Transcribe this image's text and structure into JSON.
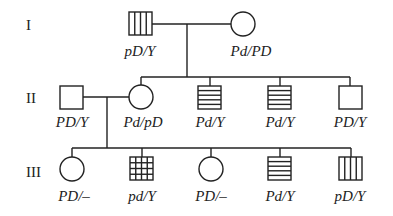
{
  "generations": [
    {
      "label": "I"
    },
    {
      "label": "II"
    },
    {
      "label": "III"
    }
  ],
  "individuals": {
    "I_1": {
      "sex": "male",
      "pattern": "vertical-stripes",
      "genotype": "pD/Y"
    },
    "I_2": {
      "sex": "female",
      "pattern": "none",
      "genotype": "Pd/PD"
    },
    "II_1": {
      "sex": "male",
      "pattern": "none",
      "genotype": "PD/Y"
    },
    "II_2": {
      "sex": "female",
      "pattern": "none",
      "genotype": "Pd/pD"
    },
    "II_3": {
      "sex": "male",
      "pattern": "horizontal-stripes",
      "genotype": "Pd/Y"
    },
    "II_4": {
      "sex": "male",
      "pattern": "horizontal-stripes",
      "genotype": "Pd/Y"
    },
    "II_5": {
      "sex": "male",
      "pattern": "none",
      "genotype": "PD/Y"
    },
    "III_1": {
      "sex": "female",
      "pattern": "none",
      "genotype": "PD/–"
    },
    "III_2": {
      "sex": "male",
      "pattern": "grid",
      "genotype": "pd/Y"
    },
    "III_3": {
      "sex": "female",
      "pattern": "none",
      "genotype": "PD/–"
    },
    "III_4": {
      "sex": "male",
      "pattern": "horizontal-stripes",
      "genotype": "Pd/Y"
    },
    "III_5": {
      "sex": "male",
      "pattern": "vertical-stripes",
      "genotype": "pD/Y"
    }
  },
  "legend_patterns": {
    "vertical-stripes": "affected trait 1 (pD)",
    "horizontal-stripes": "affected trait 2 (Pd)",
    "grid": "both traits (pd)"
  }
}
